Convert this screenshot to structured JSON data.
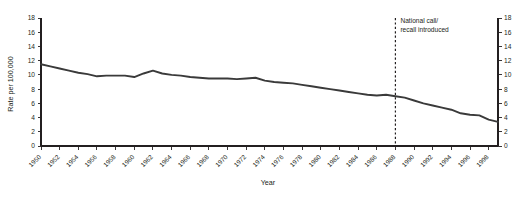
{
  "chart_data": {
    "type": "line",
    "title": "",
    "xlabel": "Year",
    "ylabel": "Rate per 100,000",
    "xlim": [
      1950,
      1999
    ],
    "ylim": [
      0,
      18
    ],
    "grid": false,
    "legend": "none",
    "y_ticks": [
      0,
      2,
      4,
      6,
      8,
      10,
      12,
      14,
      16,
      18
    ],
    "y_ticks_right": [
      0,
      2,
      4,
      6,
      8,
      10,
      12,
      14,
      16,
      18
    ],
    "x_ticks": [
      1950,
      1952,
      1954,
      1956,
      1958,
      1960,
      1962,
      1964,
      1966,
      1968,
      1970,
      1972,
      1974,
      1976,
      1978,
      1980,
      1982,
      1984,
      1986,
      1988,
      1990,
      1992,
      1994,
      1996,
      1998
    ],
    "annotations": [
      {
        "text_line1": "National call/",
        "text_line2": "recall introduced",
        "x": 1988,
        "style": "dashed-vertical-line"
      }
    ],
    "series": [
      {
        "name": "Rate per 100,000",
        "color": "#3a3a3a",
        "x": [
          1950,
          1951,
          1952,
          1953,
          1954,
          1955,
          1956,
          1957,
          1958,
          1959,
          1960,
          1961,
          1962,
          1963,
          1964,
          1965,
          1966,
          1967,
          1968,
          1969,
          1970,
          1971,
          1972,
          1973,
          1974,
          1975,
          1976,
          1977,
          1978,
          1979,
          1980,
          1981,
          1982,
          1983,
          1984,
          1985,
          1986,
          1987,
          1988,
          1989,
          1990,
          1991,
          1992,
          1993,
          1994,
          1995,
          1996,
          1997,
          1998,
          1999
        ],
        "values": [
          11.5,
          11.2,
          10.9,
          10.6,
          10.3,
          10.1,
          9.8,
          9.9,
          9.9,
          9.9,
          9.7,
          10.2,
          10.6,
          10.2,
          10.0,
          9.9,
          9.7,
          9.6,
          9.5,
          9.5,
          9.5,
          9.4,
          9.5,
          9.6,
          9.2,
          9.0,
          8.9,
          8.8,
          8.6,
          8.4,
          8.2,
          8.0,
          7.8,
          7.6,
          7.4,
          7.2,
          7.1,
          7.2,
          7.0,
          6.8,
          6.4,
          6.0,
          5.7,
          5.4,
          5.1,
          4.6,
          4.4,
          4.3,
          3.7,
          3.4
        ]
      }
    ]
  }
}
